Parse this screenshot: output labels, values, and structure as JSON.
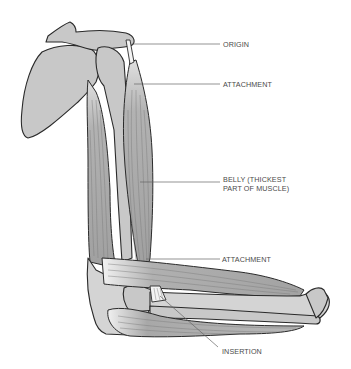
{
  "diagram": {
    "labels": [
      {
        "id": "origin",
        "text": "ORIGIN"
      },
      {
        "id": "attachment-top",
        "text": "ATTACHMENT"
      },
      {
        "id": "belly",
        "line1": "BELLY (THICKEST",
        "line2": "PART OF MUSCLE)"
      },
      {
        "id": "attachment-bottom",
        "text": "ATTACHMENT"
      },
      {
        "id": "insertion",
        "text": "INSERTION"
      }
    ],
    "colors": {
      "background": "#ffffff",
      "bone": "#c8c8c8",
      "muscle": "#a8a8a8",
      "outline": "#2a2a2a",
      "label_text": "#4a4a4a",
      "leader_line": "#666666"
    }
  }
}
